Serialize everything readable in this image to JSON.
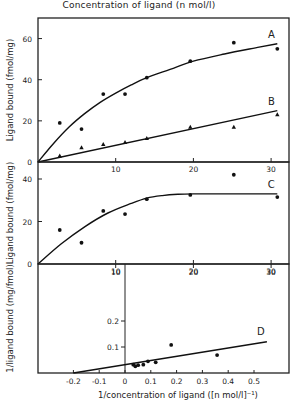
{
  "figure": {
    "top_xlabel": "Concentration of ligand (n mol/l)",
    "bottom_xlabel": "1/concentration of ligand ([n mol/l]⁻¹)"
  },
  "chart_data": [
    {
      "id": "panel-top",
      "type": "scatter",
      "title": "",
      "xlabel": "Concentration of ligand (n mol/l)",
      "ylabel": "Ligand bound (fmol/mg)",
      "xlim": [
        0,
        32
      ],
      "ylim": [
        0,
        70
      ],
      "xticks": [
        10,
        20,
        30
      ],
      "yticks": [
        0,
        20,
        40,
        60
      ],
      "grid": false,
      "series": [
        {
          "name": "A",
          "marker": "circle",
          "x": [
            2.8,
            5.6,
            8.4,
            11.2,
            14,
            19.6,
            25.2,
            30.8
          ],
          "y": [
            19,
            16,
            33,
            33,
            41,
            49,
            58,
            55
          ],
          "fit_x": [
            0,
            2,
            4,
            6,
            8,
            10,
            12,
            14,
            17,
            20,
            24,
            28,
            30.8
          ],
          "fit_y": [
            0,
            9,
            17,
            23.5,
            29,
            33.5,
            37.5,
            41,
            45,
            49,
            52.5,
            55.5,
            57.5
          ]
        },
        {
          "name": "B",
          "marker": "triangle",
          "x": [
            2.8,
            5.6,
            8.4,
            11.2,
            14,
            19.6,
            25.2,
            30.8
          ],
          "y": [
            3,
            7,
            8.5,
            9.5,
            11.5,
            17,
            17,
            23
          ],
          "fit_x": [
            0,
            30.8
          ],
          "fit_y": [
            0,
            25
          ]
        }
      ]
    },
    {
      "id": "panel-middle",
      "type": "scatter",
      "title": "",
      "xlabel": "",
      "ylabel": "Ligand bound (fmol/mg)",
      "xlim": [
        0,
        32
      ],
      "ylim": [
        0,
        48
      ],
      "xticks": [
        10,
        20,
        30
      ],
      "yticks": [
        0,
        20,
        40
      ],
      "grid": false,
      "series": [
        {
          "name": "C",
          "marker": "circle",
          "x": [
            2.8,
            5.6,
            8.4,
            11.2,
            14,
            19.6,
            25.2,
            30.8
          ],
          "y": [
            16,
            10,
            25,
            23.5,
            30.5,
            32.5,
            42,
            31.5
          ],
          "fit_x": [
            0,
            3,
            6,
            9,
            12,
            14,
            16,
            18,
            20,
            24,
            30.8
          ],
          "fit_y": [
            0,
            9.5,
            17.5,
            24,
            28.5,
            31,
            32.2,
            32.8,
            33,
            33,
            33
          ]
        }
      ]
    },
    {
      "id": "panel-bottom",
      "type": "scatter",
      "title": "",
      "xlabel": "1/concentration of ligand ([n mol/l]⁻¹)",
      "ylabel": "1/ligand bound (mg/fmol)",
      "xlim": [
        -0.33,
        0.6
      ],
      "ylim": [
        0,
        0.35
      ],
      "xticks": [
        -0.2,
        -0.1,
        0,
        0.1,
        0.2,
        0.3,
        0.4,
        0.5
      ],
      "xticklabels": [
        "-0.2",
        "-0.1",
        "0",
        "0.1",
        "0.2",
        "0.3",
        "0.4",
        "0.5"
      ],
      "yticks": [
        0.1,
        0.2
      ],
      "yticklabels": [
        "0.1",
        "0.2"
      ],
      "top_xticks": [
        10,
        20,
        30
      ],
      "grid": false,
      "series": [
        {
          "name": "D",
          "marker": "circle",
          "x": [
            0.032,
            0.04,
            0.051,
            0.071,
            0.089,
            0.119,
            0.179,
            0.357
          ],
          "y": [
            0.032,
            0.026,
            0.03,
            0.032,
            0.045,
            0.041,
            0.108,
            0.069
          ],
          "fit_x": [
            -0.2,
            0.55
          ],
          "fit_y": [
            0,
            0.12
          ]
        }
      ]
    }
  ]
}
